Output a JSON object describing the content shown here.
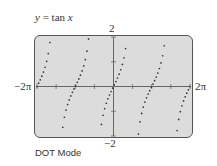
{
  "chart_data": {
    "type": "scatter",
    "title": "y = tan x",
    "function": "tan",
    "mode": "DOT Mode",
    "xlim": [
      "-2π",
      "2π"
    ],
    "xlim_values": [
      -6.2832,
      6.2832
    ],
    "ylim": [
      -2,
      2
    ],
    "x_tick_step": "π/2",
    "y_tick_step": 1,
    "xmin_label": "−2π",
    "xmax_label": "2π",
    "ymax_label": "2",
    "ymin_label": "−2",
    "sample_count": 95,
    "grid": false,
    "colors": {
      "screen_bg": "#dcdcdc",
      "axis": "#666666",
      "dot": "#333333",
      "border": "#555555"
    }
  }
}
